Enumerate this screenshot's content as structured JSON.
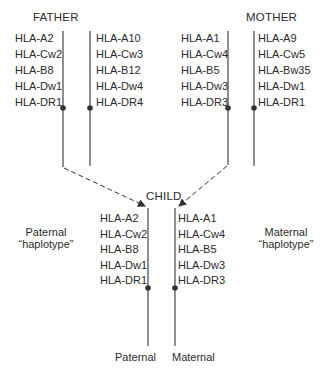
{
  "father": {
    "title": "FATHER",
    "haplotype_1": [
      "HLA-A2",
      "HLA-Cw2",
      "HLA-B8",
      "HLA-Dw1",
      "HLA-DR1"
    ],
    "haplotype_2": [
      "HLA-A10",
      "HLA-Cw3",
      "HLA-B12",
      "HLA-Dw4",
      "HLA-DR4"
    ]
  },
  "mother": {
    "title": "MOTHER",
    "haplotype_1": [
      "HLA-A1",
      "HLA-Cw4",
      "HLA-B5",
      "HLA-Dw3",
      "HLA-DR3"
    ],
    "haplotype_2": [
      "HLA-A9",
      "HLA-Cw5",
      "HLA-Bw35",
      "HLA-Dw1",
      "HLA-DR1"
    ]
  },
  "child": {
    "title": "CHILD",
    "paternal": [
      "HLA-A2",
      "HLA-Cw2",
      "HLA-B8",
      "HLA-Dw1",
      "HLA-DR1"
    ],
    "maternal": [
      "HLA-A1",
      "HLA-Cw4",
      "HLA-B5",
      "HLA-Dw3",
      "HLA-DR3"
    ],
    "paternal_label": "Paternal",
    "maternal_label": "Maternal"
  },
  "side_labels": {
    "paternal_line1": "Paternal",
    "paternal_line2": "“haplotype”",
    "maternal_line1": "Maternal",
    "maternal_line2": "“haplotype”"
  },
  "colors": {
    "line": "#3a3a3a",
    "text": "#2b2b2b"
  }
}
